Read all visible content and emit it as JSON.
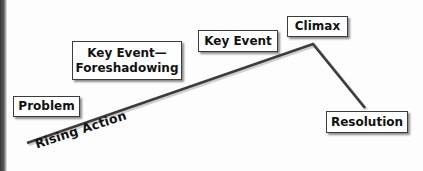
{
  "diagram": {
    "type": "plot-structure-line",
    "line_color": "#3c3c3c",
    "points": {
      "start": [
        27,
        143
      ],
      "peak": [
        313,
        44
      ],
      "end": [
        365,
        108
      ]
    },
    "axis_label": "Rising Action",
    "boxes": {
      "problem": {
        "label": "Problem"
      },
      "foreshadowing": {
        "line1": "Key Event—",
        "line2": "Foreshadowing"
      },
      "key_event": {
        "label": "Key Event"
      },
      "climax": {
        "label": "Climax"
      },
      "resolution": {
        "label": "Resolution"
      }
    }
  }
}
